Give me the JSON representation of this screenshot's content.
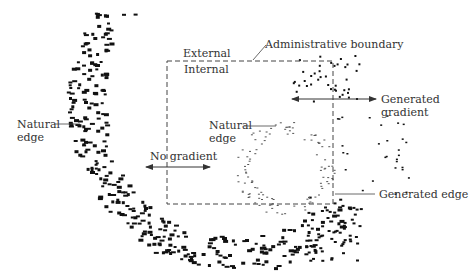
{
  "diagram": {
    "type": "settlement-boundary-schematic",
    "boundary": {
      "x": 167,
      "y": 61,
      "width": 166,
      "height": 143,
      "style": "dashed"
    },
    "labels": {
      "administrative_boundary": "Administrative boundary",
      "external": "External",
      "internal": "Internal",
      "natural_edge_left_line1": "Natural",
      "natural_edge_left_line2": "edge",
      "natural_edge_center_line1": "Natural",
      "natural_edge_center_line2": "edge",
      "no_gradient": "No gradient",
      "generated_gradient_line1": "Generated",
      "generated_gradient_line2": "gradient",
      "generated_edge": "Generated edge"
    },
    "colors": {
      "dots": "#111111",
      "faint_dots": "#555555",
      "lines": "#444444",
      "text": "#333333"
    }
  }
}
